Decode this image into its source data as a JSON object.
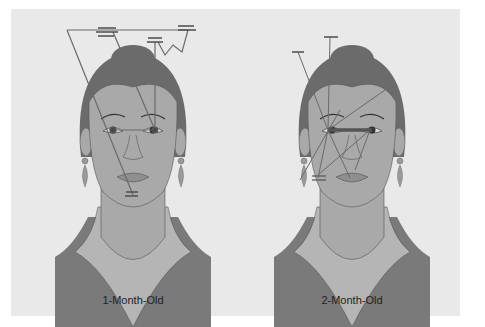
{
  "figures": [
    {
      "label": "1-Month-Old",
      "scanpath": "external-features"
    },
    {
      "label": "2-Month-Old",
      "scanpath": "internal-features"
    }
  ],
  "colors": {
    "background": "#e9e9e9",
    "hair": "#6b6b6b",
    "skin": "#a9a9a9",
    "clothing": "#7a7a7a",
    "collar": "#b5b5b5",
    "scan_line": "#6a6a6a",
    "fixation": "#555555"
  }
}
